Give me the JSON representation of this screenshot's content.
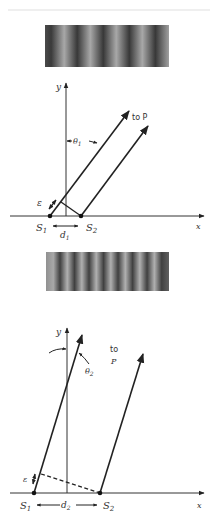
{
  "figure": {
    "top_rule_color": "#eeeeee",
    "panel_1": {
      "fringe_pattern": {
        "dark_fringe_count": 5,
        "fringe_spacing_px": 26
      },
      "axes": {
        "x_label": "x",
        "y_label": "y"
      },
      "sources": {
        "s1_label": "S",
        "s1_sub": "1",
        "s2_label": "S",
        "s2_sub": "2"
      },
      "angle_label": "θ",
      "angle_sub": "1",
      "separation_label": "d",
      "separation_sub": "1",
      "path_difference_label": "ε",
      "ray_target_label": "to P"
    },
    "panel_2": {
      "fringe_pattern": {
        "dark_fringe_count": 8,
        "fringe_spacing_px": 14.5
      },
      "axes": {
        "x_label": "x",
        "y_label": "y"
      },
      "sources": {
        "s1_label": "S",
        "s1_sub": "1",
        "s2_label": "S",
        "s2_sub": "2"
      },
      "angle_label": "θ",
      "angle_sub": "2",
      "separation_label": "d",
      "separation_sub": "2",
      "path_difference_label": "ε",
      "ray_target_label_line1": "to",
      "ray_target_label_line2": "P"
    }
  }
}
